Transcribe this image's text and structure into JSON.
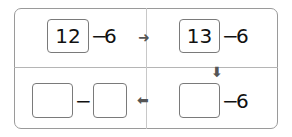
{
  "cells": {
    "top_left": {
      "box_value": "12",
      "operator": "−",
      "operand": "6"
    },
    "top_right": {
      "box_value": "13",
      "operator": "−",
      "operand": "6"
    },
    "bottom_right": {
      "box_value": "",
      "operator": "−",
      "operand": "6"
    },
    "bottom_left": {
      "box1_value": "",
      "operator": "−",
      "box2_value": ""
    }
  },
  "arrows": {
    "right": "➜",
    "down": "⬇",
    "left": "⬅"
  }
}
